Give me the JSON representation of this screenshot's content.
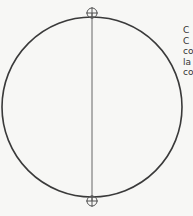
{
  "diagram": {
    "shape": "circle",
    "diameter_line": "vertical",
    "markers": [
      {
        "name": "top-crosshair",
        "position": "top"
      },
      {
        "name": "bottom-crosshair",
        "position": "bottom"
      }
    ],
    "colors": {
      "stroke": "#3a3a3a",
      "marker": "#555555",
      "background": "#f7f7f5"
    }
  },
  "side_text": {
    "lines": [
      "C",
      "C",
      "co",
      "la",
      "co"
    ]
  }
}
